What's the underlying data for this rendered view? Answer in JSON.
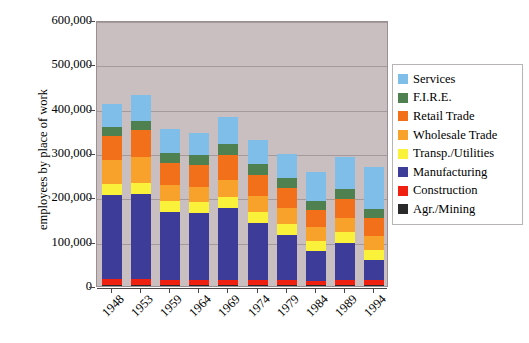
{
  "chart_data": {
    "type": "bar",
    "stacked": true,
    "title": "",
    "xlabel": "",
    "ylabel": "employees by place of work",
    "ylim": [
      0,
      600000
    ],
    "ytick_values": [
      0,
      100000,
      200000,
      300000,
      400000,
      500000,
      600000
    ],
    "ytick_labels": [
      "0",
      "100,000",
      "200,000",
      "300,000",
      "400,000",
      "500,000",
      "600,000"
    ],
    "grid": true,
    "legend_position": "right",
    "categories": [
      "1948",
      "1953",
      "1959",
      "1964",
      "1969",
      "1974",
      "1979",
      "1984",
      "1989",
      "1994"
    ],
    "series": [
      {
        "name": "Agr./Mining",
        "color": "#2a2a2a",
        "values": [
          2000,
          2000,
          1500,
          1500,
          1500,
          1500,
          1500,
          1500,
          1500,
          1500
        ]
      },
      {
        "name": "Construction",
        "color": "#f02010",
        "values": [
          13000,
          13000,
          11000,
          11000,
          11000,
          11000,
          11000,
          10000,
          12000,
          11000
        ]
      },
      {
        "name": "Manufacturing",
        "color": "#3d3d99",
        "values": [
          190000,
          193000,
          155000,
          152000,
          163000,
          130000,
          103000,
          68000,
          83000,
          46000
        ]
      },
      {
        "name": "Transp./Utilities",
        "color": "#faf23a",
        "values": [
          25000,
          25000,
          24000,
          25000,
          26000,
          25000,
          25000,
          23000,
          25000,
          23000
        ]
      },
      {
        "name": "Wholesale Trade",
        "color": "#f9a22b",
        "values": [
          54000,
          57000,
          36000,
          35000,
          38000,
          36000,
          35000,
          30000,
          33000,
          32000
        ]
      },
      {
        "name": "Retail Trade",
        "color": "#f2701a",
        "values": [
          54000,
          61000,
          50000,
          48000,
          56000,
          48000,
          45000,
          39000,
          42000,
          39000
        ]
      },
      {
        "name": "F.I.R.E.",
        "color": "#4f8050",
        "values": [
          20000,
          22000,
          22000,
          22000,
          25000,
          24000,
          23000,
          20000,
          22000,
          21000
        ]
      },
      {
        "name": "Services",
        "color": "#7fbee8",
        "values": [
          53000,
          58000,
          54000,
          51000,
          60000,
          53000,
          55000,
          66000,
          72000,
          94000
        ]
      }
    ],
    "totals": [
      411000,
      431000,
      353500,
      345500,
      380500,
      328500,
      298500,
      257500,
      290500,
      267500
    ]
  },
  "legend": {
    "items": [
      {
        "label": "Services",
        "color": "#7fbee8"
      },
      {
        "label": "F.I.R.E.",
        "color": "#4f8050"
      },
      {
        "label": "Retail Trade",
        "color": "#f2701a"
      },
      {
        "label": "Wholesale Trade",
        "color": "#f9a22b"
      },
      {
        "label": "Transp./Utilities",
        "color": "#faf23a"
      },
      {
        "label": "Manufacturing",
        "color": "#3d3d99"
      },
      {
        "label": "Construction",
        "color": "#f02010"
      },
      {
        "label": "Agr./Mining",
        "color": "#2a2a2a"
      }
    ]
  },
  "style": {
    "plot_background": "#c9bfc0",
    "gridline_color": "#a49a9c",
    "axis_color": "#4a4446",
    "legend_background": "#ffffff",
    "legend_border": "#b9b4b4"
  }
}
